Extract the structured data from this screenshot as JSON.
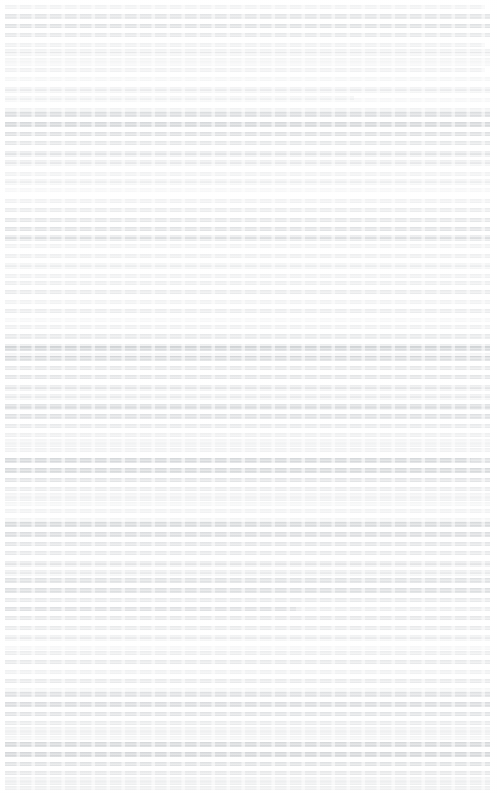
{
  "page": {
    "kind": "document-page",
    "width": 498,
    "height": 793,
    "background_color": "#ffffff",
    "condition": "severely degraded: strong horizontal motion blur / smearing has rendered all glyphs unreadable",
    "recoverable_text": "none",
    "ink_color_darkest": "#b8bcc0",
    "ink_color_typical": "#dde0e2",
    "text_alignment": "justified",
    "margin_left_px": 5,
    "margin_right_px": 8,
    "line_pitch_px": 9.5,
    "estimated_line_count": 78,
    "notes_label": "Illegible smeared document page"
  },
  "blocks": [
    {
      "top": 2,
      "lines": [
        {
          "h": 4,
          "w": 99,
          "d": 0.3
        },
        {
          "h": 5,
          "w": 100,
          "d": 0.62
        },
        {
          "h": 4,
          "w": 100,
          "d": 0.7
        },
        {
          "h": 4,
          "w": 100,
          "d": 0.55
        },
        {
          "h": 4,
          "w": 99,
          "d": 0.34
        },
        {
          "h": 4,
          "w": 100,
          "d": 0.26
        },
        {
          "h": 4,
          "w": 100,
          "d": 0.2
        }
      ]
    },
    {
      "top": 46,
      "lines": [
        {
          "h": 4,
          "w": 100,
          "d": 0.3
        },
        {
          "h": 4,
          "w": 100,
          "d": 0.24
        },
        {
          "h": 4,
          "w": 99,
          "d": 0.32
        },
        {
          "h": 4,
          "w": 100,
          "d": 0.22
        },
        {
          "h": 4,
          "w": 100,
          "d": 0.28
        },
        {
          "h": 4,
          "w": 72,
          "d": 0.22
        }
      ]
    },
    {
      "top": 86,
      "lines": [
        {
          "h": 4,
          "w": 100,
          "d": 0.26
        },
        {
          "h": 4,
          "w": 100,
          "d": 0.2
        },
        {
          "h": 4,
          "w": 100,
          "d": 0.3
        }
      ]
    },
    {
      "top": 110,
      "lines": [
        {
          "h": 5,
          "w": 100,
          "d": 0.8
        },
        {
          "h": 5,
          "w": 100,
          "d": 0.92
        },
        {
          "h": 4,
          "w": 100,
          "d": 0.74
        },
        {
          "h": 4,
          "w": 100,
          "d": 0.58
        },
        {
          "h": 4,
          "w": 100,
          "d": 0.44
        },
        {
          "h": 4,
          "w": 100,
          "d": 0.36
        }
      ]
    },
    {
      "top": 150,
      "lines": [
        {
          "h": 4,
          "w": 100,
          "d": 0.34
        },
        {
          "h": 4,
          "w": 100,
          "d": 0.26
        },
        {
          "h": 4,
          "w": 100,
          "d": 0.3
        },
        {
          "h": 4,
          "w": 100,
          "d": 0.22
        }
      ]
    },
    {
      "top": 176,
      "lines": [
        {
          "h": 4,
          "w": 100,
          "d": 0.26
        },
        {
          "h": 4,
          "w": 100,
          "d": 0.2
        }
      ]
    },
    {
      "top": 196,
      "lines": [
        {
          "h": 4,
          "w": 100,
          "d": 0.32
        },
        {
          "h": 4,
          "w": 100,
          "d": 0.46
        },
        {
          "h": 4,
          "w": 100,
          "d": 0.58
        },
        {
          "h": 4,
          "w": 100,
          "d": 0.66
        },
        {
          "h": 4,
          "w": 100,
          "d": 0.5
        }
      ]
    },
    {
      "top": 232,
      "lines": [
        {
          "h": 4,
          "w": 100,
          "d": 0.44
        },
        {
          "h": 4,
          "w": 100,
          "d": 0.3
        },
        {
          "h": 4,
          "w": 100,
          "d": 0.38
        },
        {
          "h": 4,
          "w": 100,
          "d": 0.24
        }
      ]
    },
    {
      "top": 262,
      "lines": [
        {
          "h": 4,
          "w": 100,
          "d": 0.26
        },
        {
          "h": 4,
          "w": 100,
          "d": 0.34
        }
      ]
    },
    {
      "top": 278,
      "lines": [
        {
          "h": 4,
          "w": 100,
          "d": 0.4
        },
        {
          "h": 4,
          "w": 100,
          "d": 0.48
        },
        {
          "h": 4,
          "w": 100,
          "d": 0.3
        },
        {
          "h": 4,
          "w": 100,
          "d": 0.22
        }
      ]
    },
    {
      "top": 306,
      "lines": [
        {
          "h": 4,
          "w": 100,
          "d": 0.24
        },
        {
          "h": 4,
          "w": 100,
          "d": 0.18
        }
      ]
    },
    {
      "top": 322,
      "lines": [
        {
          "h": 4,
          "w": 100,
          "d": 0.36
        },
        {
          "h": 5,
          "w": 100,
          "d": 0.52
        },
        {
          "h": 4,
          "w": 100,
          "d": 0.4
        },
        {
          "h": 4,
          "w": 100,
          "d": 0.28
        }
      ]
    },
    {
      "top": 344,
      "lines": [
        {
          "h": 5,
          "w": 100,
          "d": 0.86
        },
        {
          "h": 5,
          "w": 100,
          "d": 0.78
        },
        {
          "h": 4,
          "w": 100,
          "d": 0.56
        },
        {
          "h": 4,
          "w": 100,
          "d": 0.62
        },
        {
          "h": 4,
          "w": 100,
          "d": 0.42
        },
        {
          "h": 4,
          "w": 100,
          "d": 0.34
        }
      ]
    },
    {
      "top": 384,
      "lines": [
        {
          "h": 4,
          "w": 100,
          "d": 0.3
        },
        {
          "h": 4,
          "w": 100,
          "d": 0.24
        },
        {
          "h": 4,
          "w": 100,
          "d": 0.28
        }
      ]
    },
    {
      "top": 402,
      "lines": [
        {
          "h": 5,
          "w": 100,
          "d": 0.66
        },
        {
          "h": 5,
          "w": 100,
          "d": 0.72
        },
        {
          "h": 4,
          "w": 100,
          "d": 0.5
        },
        {
          "h": 4,
          "w": 100,
          "d": 0.38
        },
        {
          "h": 4,
          "w": 100,
          "d": 0.3
        }
      ]
    },
    {
      "top": 436,
      "lines": [
        {
          "h": 4,
          "w": 100,
          "d": 0.26
        },
        {
          "h": 4,
          "w": 100,
          "d": 0.32
        },
        {
          "h": 4,
          "w": 96,
          "d": 0.22
        }
      ]
    },
    {
      "top": 456,
      "lines": [
        {
          "h": 5,
          "w": 100,
          "d": 0.74
        },
        {
          "h": 5,
          "w": 100,
          "d": 0.88
        },
        {
          "h": 4,
          "w": 100,
          "d": 0.64
        },
        {
          "h": 4,
          "w": 100,
          "d": 0.46
        },
        {
          "h": 4,
          "w": 100,
          "d": 0.34
        }
      ]
    },
    {
      "top": 490,
      "lines": [
        {
          "h": 4,
          "w": 100,
          "d": 0.28
        },
        {
          "h": 4,
          "w": 100,
          "d": 0.22
        }
      ]
    },
    {
      "top": 506,
      "lines": [
        {
          "h": 4,
          "w": 100,
          "d": 0.3
        },
        {
          "h": 4,
          "w": 100,
          "d": 0.24
        }
      ]
    },
    {
      "top": 520,
      "lines": [
        {
          "h": 5,
          "w": 100,
          "d": 0.88
        },
        {
          "h": 5,
          "w": 100,
          "d": 0.8
        },
        {
          "h": 4,
          "w": 100,
          "d": 0.62
        },
        {
          "h": 4,
          "w": 100,
          "d": 0.54
        },
        {
          "h": 4,
          "w": 100,
          "d": 0.44
        },
        {
          "h": 4,
          "w": 100,
          "d": 0.36
        }
      ]
    },
    {
      "top": 560,
      "lines": [
        {
          "h": 4,
          "w": 100,
          "d": 0.3
        },
        {
          "h": 4,
          "w": 100,
          "d": 0.22
        }
      ]
    },
    {
      "top": 576,
      "lines": [
        {
          "h": 5,
          "w": 100,
          "d": 0.7
        },
        {
          "h": 5,
          "w": 100,
          "d": 0.76
        },
        {
          "h": 4,
          "w": 100,
          "d": 0.52
        },
        {
          "h": 4,
          "w": 60,
          "d": 0.34
        }
      ]
    },
    {
      "top": 604,
      "lines": [
        {
          "h": 4,
          "w": 100,
          "d": 0.44
        },
        {
          "h": 4,
          "w": 100,
          "d": 0.56
        },
        {
          "h": 4,
          "w": 100,
          "d": 0.48
        },
        {
          "h": 4,
          "w": 100,
          "d": 0.3
        }
      ]
    },
    {
      "top": 634,
      "lines": [
        {
          "h": 4,
          "w": 100,
          "d": 0.26
        },
        {
          "h": 4,
          "w": 100,
          "d": 0.2
        }
      ]
    },
    {
      "top": 648,
      "lines": [
        {
          "h": 4,
          "w": 100,
          "d": 0.42
        },
        {
          "h": 4,
          "w": 100,
          "d": 0.52
        },
        {
          "h": 4,
          "w": 100,
          "d": 0.34
        },
        {
          "h": 4,
          "w": 100,
          "d": 0.24
        }
      ]
    },
    {
      "top": 676,
      "lines": [
        {
          "h": 4,
          "w": 100,
          "d": 0.28
        },
        {
          "h": 4,
          "w": 100,
          "d": 0.22
        }
      ]
    },
    {
      "top": 690,
      "lines": [
        {
          "h": 5,
          "w": 100,
          "d": 0.72
        },
        {
          "h": 5,
          "w": 100,
          "d": 0.84
        },
        {
          "h": 4,
          "w": 100,
          "d": 0.66
        },
        {
          "h": 4,
          "w": 100,
          "d": 0.48
        },
        {
          "h": 4,
          "w": 100,
          "d": 0.36
        }
      ]
    },
    {
      "top": 724,
      "lines": [
        {
          "h": 4,
          "w": 100,
          "d": 0.3
        },
        {
          "h": 4,
          "w": 100,
          "d": 0.24
        }
      ]
    },
    {
      "top": 740,
      "lines": [
        {
          "h": 5,
          "w": 100,
          "d": 0.9
        },
        {
          "h": 5,
          "w": 100,
          "d": 0.94
        },
        {
          "h": 4,
          "w": 100,
          "d": 0.7
        },
        {
          "h": 4,
          "w": 100,
          "d": 0.56
        },
        {
          "h": 4,
          "w": 100,
          "d": 0.4
        }
      ]
    },
    {
      "top": 774,
      "lines": [
        {
          "h": 4,
          "w": 100,
          "d": 0.3
        },
        {
          "h": 4,
          "w": 100,
          "d": 0.38
        },
        {
          "h": 4,
          "w": 100,
          "d": 0.2
        }
      ]
    }
  ],
  "haze_bands": [
    {
      "top": 0,
      "height": 793,
      "opacity": 0.05
    }
  ]
}
